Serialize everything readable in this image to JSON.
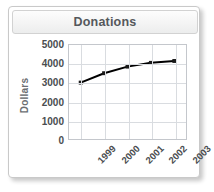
{
  "widget": {
    "title": "Donations"
  },
  "chart_data": {
    "type": "line",
    "title": "Donations",
    "xlabel": "",
    "ylabel": "Dollars",
    "categories": [
      "1999",
      "2000",
      "2001",
      "2002",
      "2003"
    ],
    "values": [
      3000,
      3500,
      3850,
      4050,
      4150
    ],
    "series": [
      {
        "name": "Donations",
        "values": [
          3000,
          3500,
          3850,
          4050,
          4150
        ]
      }
    ],
    "ylim": [
      0,
      5000
    ],
    "y_ticks": [
      5000,
      4000,
      3000,
      2000,
      1000,
      0
    ],
    "y_tick_labels": [
      "5000",
      "4000",
      "3000",
      "2000",
      "1000",
      "0"
    ],
    "grid": true,
    "legend": "none",
    "line_color": "#000000",
    "marker": "square",
    "marker_color": "#1a1a1a",
    "grid_color": "#d9dce0",
    "axis_color": "#c4c7cc",
    "text_color": "#4a4d50",
    "title_color": "#55585c"
  }
}
